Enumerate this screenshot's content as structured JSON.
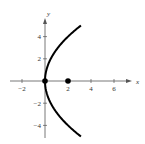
{
  "chart_data": {
    "type": "line",
    "title": "",
    "xlabel": "x",
    "ylabel": "y",
    "xlim": [
      -3,
      8
    ],
    "ylim": [
      -5.5,
      6.5
    ],
    "grid": false,
    "x_ticks": [
      -2,
      2,
      4,
      6
    ],
    "y_ticks": [
      -4,
      -2,
      2,
      4
    ],
    "x_tick_labels": [
      "−2",
      "2",
      "4",
      "6"
    ],
    "y_tick_labels": [
      "−4",
      "−2",
      "2",
      "4"
    ],
    "series": [
      {
        "name": "parabola y^2 = 8x",
        "equation": "y^2 = 8x",
        "y_range": [
          -5,
          5
        ],
        "color": "#000000"
      }
    ],
    "points": [
      {
        "name": "vertex",
        "x": 0,
        "y": 0,
        "color": "#000000"
      },
      {
        "name": "focus",
        "x": 2,
        "y": 0,
        "color": "#000000"
      }
    ]
  }
}
